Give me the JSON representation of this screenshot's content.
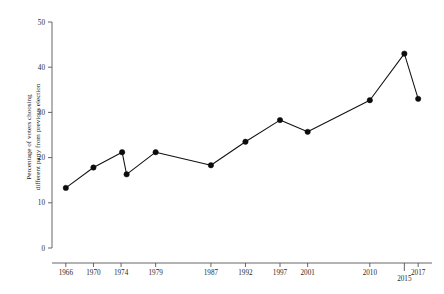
{
  "chart_data": {
    "type": "line",
    "title": "",
    "subtitle": "",
    "xlabel": "",
    "ylabel": "Percentage of voters choosing different party from previous election",
    "ylabel_line1": "Percentage of voters choosing",
    "ylabel_line2": "different party from previous election",
    "xlim": [
      1964,
      2019
    ],
    "ylim": [
      0,
      50
    ],
    "y_ticks": [
      0,
      10,
      20,
      30,
      40,
      50
    ],
    "y_tick_labels": [
      "0",
      "10",
      "20",
      "30",
      "40",
      "50"
    ],
    "x_ticks": [
      1966,
      1970,
      1974,
      1979,
      1987,
      1992,
      1997,
      2001,
      2010,
      2015,
      2017
    ],
    "x_tick_labels": [
      "1966",
      "1970",
      "1974",
      "1979",
      "1987",
      "1992",
      "1997",
      "2001",
      "2010",
      "2015",
      "2017"
    ],
    "x_tick_label_rows": [
      0,
      0,
      0,
      0,
      0,
      0,
      0,
      0,
      0,
      1,
      0
    ],
    "grid": false,
    "legend": false,
    "legend_position": "none",
    "marker": "filled-circle",
    "line_color": "#111111",
    "marker_color": "#0c0c0c",
    "axis_color": "#555555",
    "background_color": "#ffffff",
    "x": [
      1966,
      1970,
      1974.15,
      1974.8,
      1979,
      1987,
      1992,
      1997,
      2001,
      2010,
      2015,
      2017
    ],
    "values": [
      13.3,
      17.8,
      21.2,
      16.3,
      21.2,
      18.3,
      23.5,
      28.3,
      25.7,
      32.7,
      43.0,
      33.0
    ],
    "points": [
      {
        "x": 1966,
        "y": 13.3
      },
      {
        "x": 1970,
        "y": 17.8
      },
      {
        "x": 1974.15,
        "y": 21.2
      },
      {
        "x": 1974.8,
        "y": 16.3
      },
      {
        "x": 1979,
        "y": 21.2
      },
      {
        "x": 1987,
        "y": 18.3
      },
      {
        "x": 1992,
        "y": 23.5
      },
      {
        "x": 1997,
        "y": 28.3
      },
      {
        "x": 2001,
        "y": 25.7
      },
      {
        "x": 2010,
        "y": 32.7
      },
      {
        "x": 2015,
        "y": 43.0
      },
      {
        "x": 2017,
        "y": 33.0
      }
    ]
  },
  "caption": {
    "text": ""
  }
}
